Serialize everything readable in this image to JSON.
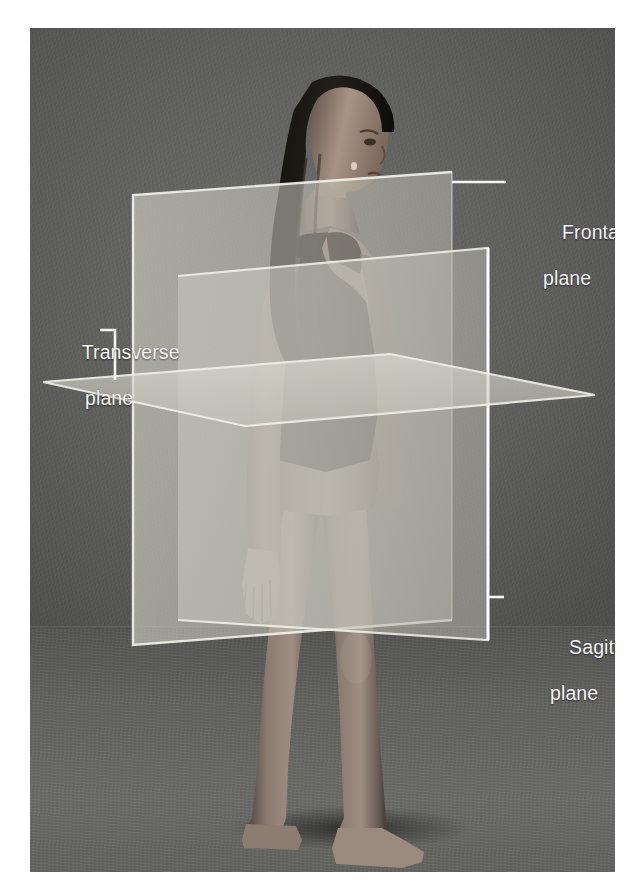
{
  "figure": {
    "kind": "anatomical-planes-photograph",
    "border_color": "#ffffff",
    "photo_background_color": "#5a5a5a",
    "label_text_color": "#f4f4f4",
    "plane_fill_color": "#c9c8c0",
    "plane_edge_color": "#f2f1ea"
  },
  "labels": [
    {
      "id": "frontal",
      "line1": "Frontal",
      "line2": "plane",
      "leader": "straight-horizontal",
      "points_to": "frontal-plane"
    },
    {
      "id": "transverse",
      "line1": "Transverse",
      "line2": "plane",
      "leader": "elbow-down-right",
      "points_to": "transverse-plane"
    },
    {
      "id": "sagittal",
      "line1": "Sagittal",
      "line2": "plane",
      "leader": "short-dash",
      "points_to": "sagittal-plane"
    }
  ],
  "planes": [
    {
      "id": "frontal-plane",
      "name": "Frontal plane",
      "orientation": "coronal / vertical, divides body into anterior and posterior",
      "rendered_as": "vertical quadrilateral behind the subject"
    },
    {
      "id": "transverse-plane",
      "name": "Transverse plane",
      "orientation": "horizontal, divides body into superior and inferior",
      "rendered_as": "horizontal parallelogram at hip level"
    },
    {
      "id": "sagittal-plane",
      "name": "Sagittal plane",
      "orientation": "vertical, divides body into left and right",
      "rendered_as": "vertical quadrilateral through the midline, receding to the right"
    }
  ],
  "subject": {
    "pose": "standing upright, arms at sides, head turned to the viewer's right",
    "attire": "dark one-piece swimsuit",
    "hair": "long box braids"
  }
}
